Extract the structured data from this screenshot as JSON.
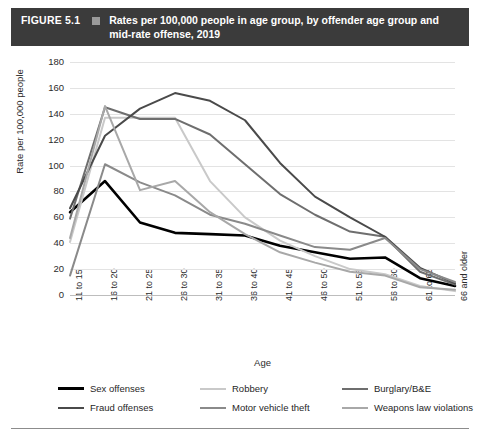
{
  "header": {
    "figure_number": "FIGURE 5.1",
    "marker": "square-marker",
    "title": "Rates per 100,000 people in age group, by offender age group and mid-rate offense, 2019",
    "background_color": "#3b3b3b",
    "text_color": "#ffffff"
  },
  "axis": {
    "x_title": "Age",
    "y_title": "Rate per 100,000 people"
  },
  "chart_data": {
    "type": "line",
    "title": "Rates per 100,000 people in age group, by offender age group and mid-rate offense, 2019",
    "xlabel": "Age",
    "ylabel": "Rate per 100,000 people",
    "ylim": [
      0,
      180
    ],
    "yticks": [
      0,
      20,
      40,
      60,
      80,
      100,
      120,
      140,
      160,
      180
    ],
    "grid": true,
    "legend_position": "bottom",
    "categories": [
      "11 to 15",
      "16 to 20",
      "21 to 25",
      "26 to 30",
      "31 to 35",
      "36 to 40",
      "41 to 45",
      "46 to 50",
      "51 to 55",
      "56 to 60",
      "61 to 65",
      "66 and older"
    ],
    "series": [
      {
        "name": "Sex offenses",
        "color": "#000000",
        "width": 2.6,
        "values": [
          64,
          88,
          56,
          48,
          47,
          46,
          38,
          33,
          28,
          29,
          13,
          7
        ]
      },
      {
        "name": "Robbery",
        "color": "#c9c9c9",
        "width": 2.0,
        "values": [
          41,
          137,
          137,
          137,
          88,
          60,
          42,
          30,
          20,
          16,
          7,
          3
        ]
      },
      {
        "name": "Burglary/B&E",
        "color": "#6e6e6e",
        "width": 2.0,
        "values": [
          59,
          145,
          136,
          136,
          124,
          101,
          78,
          62,
          49,
          45,
          18,
          8
        ]
      },
      {
        "name": "Fraud offenses",
        "color": "#4a4a4a",
        "width": 2.0,
        "values": [
          67,
          123,
          144,
          156,
          150,
          135,
          102,
          76,
          60,
          45,
          21,
          9
        ]
      },
      {
        "name": "Motor vehicle theft",
        "color": "#8a8a8a",
        "width": 2.0,
        "values": [
          15,
          101,
          87,
          77,
          62,
          55,
          46,
          37,
          35,
          44,
          20,
          10
        ]
      },
      {
        "name": "Weapons law violations",
        "color": "#a8a8a8",
        "width": 2.0,
        "values": [
          44,
          146,
          81,
          88,
          64,
          47,
          33,
          25,
          18,
          15,
          6,
          4
        ]
      }
    ]
  },
  "legend": {
    "items": [
      {
        "label": "Sex offenses",
        "color": "#000000",
        "width": 3
      },
      {
        "label": "Robbery",
        "color": "#c9c9c9",
        "width": 2.5
      },
      {
        "label": "Burglary/B&E",
        "color": "#6e6e6e",
        "width": 2.5
      },
      {
        "label": "Fraud offenses",
        "color": "#4a4a4a",
        "width": 2.5
      },
      {
        "label": "Motor vehicle theft",
        "color": "#8a8a8a",
        "width": 2.5
      },
      {
        "label": "Weapons law violations",
        "color": "#a8a8a8",
        "width": 2.5
      }
    ]
  }
}
